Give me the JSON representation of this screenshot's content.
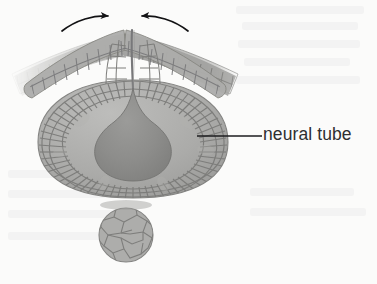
{
  "figure": {
    "domain_kind": "biology-illustration",
    "background_color": "#fbfbfa",
    "width": 377,
    "height": 284
  },
  "labels": [
    {
      "id": "neural-tube",
      "text": "neural tube",
      "color": "#2e2e30",
      "leader_line": {
        "from_x": 197,
        "from_y": 136,
        "to_x": 262,
        "to_y": 136,
        "color": "#1d1d1f"
      }
    }
  ],
  "annotations": {
    "arrows": [
      {
        "id": "left-fold-arrow",
        "direction": "points-right-inward",
        "tip_x": 112,
        "tip_y": 17,
        "color": "#121214"
      },
      {
        "id": "right-fold-arrow",
        "direction": "points-left-inward",
        "tip_x": 138,
        "tip_y": 17,
        "color": "#121214"
      }
    ]
  },
  "structures": [
    {
      "id": "neural-tube-body",
      "name": "neural tube",
      "fill": "#a8a8a6",
      "stroke": "#8a8a88",
      "bounds": {
        "x": 38,
        "y": 78,
        "w": 190,
        "h": 120
      }
    },
    {
      "id": "neural-tube-lumen",
      "name": "lumen",
      "fill": "#8b8b89",
      "shape": "teardrop",
      "bounds": {
        "x": 95,
        "y": 98,
        "w": 78,
        "h": 72
      }
    },
    {
      "id": "notochord",
      "name": "notochord",
      "fill": "#a9a9a7",
      "stroke": "#8a8a88",
      "bounds": {
        "x": 100,
        "y": 208,
        "w": 52,
        "h": 54
      }
    },
    {
      "id": "surface-ectoderm-left",
      "name": "surface ectoderm left wing",
      "fill": "#b4b4b2",
      "bounds": {
        "x": 10,
        "y": 30,
        "w": 110,
        "h": 62
      }
    },
    {
      "id": "surface-ectoderm-right",
      "name": "surface ectoderm right wing",
      "fill": "#b4b4b2",
      "bounds": {
        "x": 130,
        "y": 30,
        "w": 110,
        "h": 62
      }
    }
  ],
  "palette": {
    "cell_fill_light": "#b6b6b4",
    "cell_fill_mid": "#a5a5a3",
    "cell_fill_dark": "#949492",
    "cell_outline": "#7e7e7c",
    "lumen_dark": "#868684",
    "ink": "#1d1d1f",
    "paper": "#fbfbfa"
  }
}
